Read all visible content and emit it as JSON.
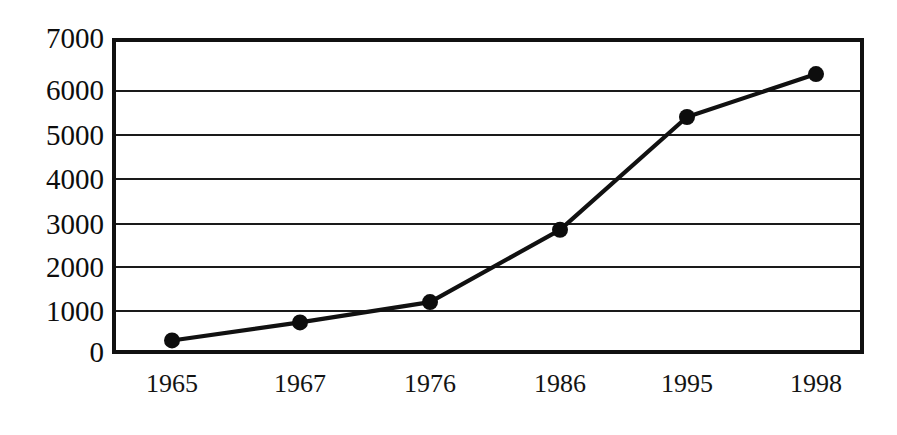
{
  "chart_data": {
    "type": "line",
    "title": "",
    "subtitle": "",
    "xlabel": "",
    "ylabel": "",
    "categories": [
      "1965",
      "1967",
      "1976",
      "1986",
      "1995",
      "1998"
    ],
    "values": [
      300,
      700,
      1150,
      2750,
      5250,
      6200
    ],
    "series": [
      {
        "name": "",
        "values": [
          300,
          700,
          1150,
          2750,
          5250,
          6200
        ]
      }
    ],
    "ylim": [
      0,
      7000
    ],
    "y_ticks": [
      0,
      1000,
      2000,
      3000,
      4000,
      5000,
      6000,
      7000
    ],
    "y_tick_labels": [
      "0",
      "1000",
      "2000",
      "3000",
      "4000",
      "5000",
      "6000",
      "7000"
    ],
    "x_tick_labels": [
      "1965",
      "1967",
      "1976",
      "1986",
      "1995",
      "1998"
    ],
    "grid": true,
    "grid_axis": "y",
    "legend": false,
    "legend_position": "none",
    "marker": "filled-circle",
    "annotations": []
  },
  "style": {
    "line_color": "#111111",
    "marker_color": "#0d0d0d",
    "grid_color": "#1a1a1a",
    "frame_color": "#111111",
    "background_color": "#ffffff",
    "text_color": "#111111"
  },
  "geometry": {
    "x_positions_px": [
      172,
      300,
      430,
      560,
      687,
      816
    ],
    "plot_left_px": 112,
    "plot_right_px": 864,
    "plot_top_px": 38,
    "plot_bottom_px": 354
  }
}
